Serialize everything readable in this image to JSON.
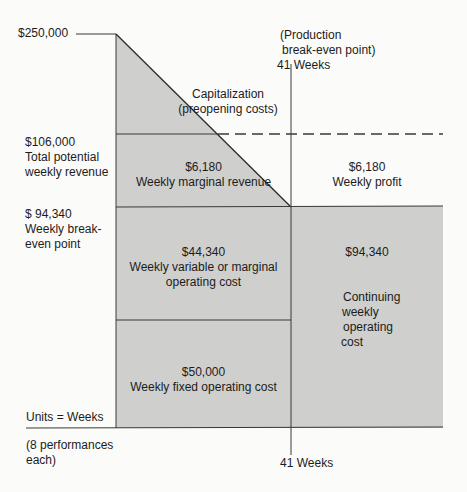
{
  "colors": {
    "shade": "#cfcfcd",
    "line": "#3a3a3a",
    "background": "#fbfbfa"
  },
  "y_axis_labels": {
    "top": "$250,000",
    "revenue_value": "$106,000",
    "revenue_line1": "Total potential",
    "revenue_line2": "weekly revenue",
    "breakeven_value": "$ 94,340",
    "breakeven_line1": "Weekly break-",
    "breakeven_line2": "even point",
    "units": "Units = Weeks",
    "perf_line1": "(8 performances",
    "perf_line2": "each)"
  },
  "production_breakeven": {
    "line1": "(Production",
    "line2": "break-even point)",
    "line3": "41 Weeks",
    "bottom_label": "41 Weeks"
  },
  "regions": {
    "capitalization": {
      "line1": "Capitalization",
      "line2": "(preopening costs)"
    },
    "marginal_revenue": {
      "value": "$6,180",
      "label": "Weekly marginal revenue"
    },
    "weekly_profit": {
      "value": "$6,180",
      "label": "Weekly profit"
    },
    "variable_cost": {
      "value": "$44,340",
      "line1": "Weekly variable or marginal",
      "line2": "operating cost"
    },
    "continuing_cost": {
      "value": "$94,340",
      "line1": "Continuing",
      "line2": "weekly",
      "line3": "operating",
      "line4": "cost"
    },
    "fixed_cost": {
      "value": "$50,000",
      "label": "Weekly fixed operating cost"
    }
  }
}
